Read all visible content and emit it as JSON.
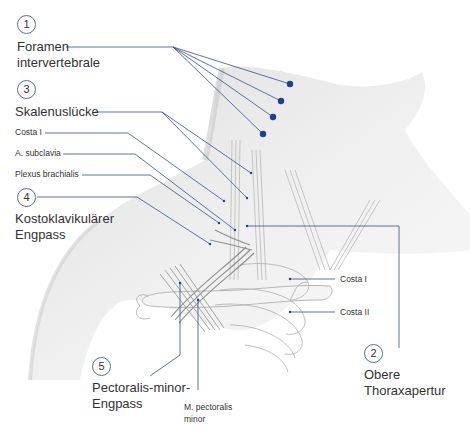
{
  "diagram": {
    "type": "anatomical illustration",
    "leader_color": "#3a4f8a",
    "dot_color": "#1f3f8f"
  },
  "numbered_labels": [
    {
      "number": "1",
      "line1": "Foramen",
      "line2": "intervertebrale"
    },
    {
      "number": "3",
      "line1": "Skalenuslücke",
      "line2": ""
    },
    {
      "number": "4",
      "line1": "Kostoklavikulärer",
      "line2": "Engpass"
    },
    {
      "number": "5",
      "line1": "Pectoralis-minor-",
      "line2": "Engpass"
    },
    {
      "number": "2",
      "line1": "Obere",
      "line2": "Thoraxapertur"
    }
  ],
  "structure_labels": {
    "costa_1_left": "Costa I",
    "a_subclavia": "A. subclavia",
    "plexus_brachialis": "Plexus brachialis",
    "costa_1_right": "Costa I",
    "costa_2_right": "Costa II",
    "m_pectoralis_minor_line1": "M. pectoralis",
    "m_pectoralis_minor_line2": "minor"
  }
}
